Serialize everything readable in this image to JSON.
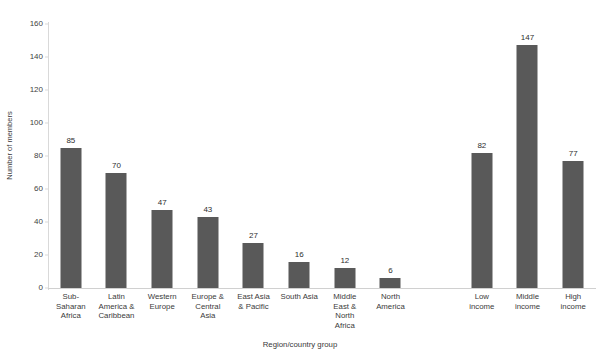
{
  "chart_data": {
    "type": "bar",
    "title": "",
    "xlabel": "Region/country group",
    "ylabel": "Number of members",
    "ylim": [
      0,
      160
    ],
    "ytick_labels": [
      "0",
      "20",
      "40",
      "60",
      "80",
      "100",
      "120",
      "140",
      "160"
    ],
    "ytick_values": [
      0,
      20,
      40,
      60,
      80,
      100,
      120,
      140,
      160
    ],
    "grid": false,
    "legend": null,
    "bar_color": "#595959",
    "categories": [
      "Sub-Saharan Africa",
      "Latin America & Caribbean",
      "Western Europe",
      "Europe & Central Asia",
      "East Asia & Pacific",
      "South Asia",
      "Middle East & North Africa",
      "North America",
      "",
      "Low income",
      "Middle income",
      "High income"
    ],
    "category_lines": [
      [
        "Sub-",
        "Saharan",
        "Africa"
      ],
      [
        "Latin",
        "America &",
        "Caribbean"
      ],
      [
        "Western",
        "Europe"
      ],
      [
        "Europe &",
        "Central",
        "Asia"
      ],
      [
        "East Asia",
        "& Pacific"
      ],
      [
        "South Asia"
      ],
      [
        "Middle",
        "East &",
        "North",
        "Africa"
      ],
      [
        "North",
        "America"
      ],
      [],
      [
        "Low",
        "income"
      ],
      [
        "Middle",
        "income"
      ],
      [
        "High",
        "income"
      ]
    ],
    "values": [
      85,
      70,
      47,
      43,
      27,
      16,
      12,
      6,
      null,
      82,
      147,
      77
    ],
    "value_labels": [
      "85",
      "70",
      "47",
      "43",
      "27",
      "16",
      "12",
      "6",
      "",
      "82",
      "147",
      "77"
    ]
  }
}
